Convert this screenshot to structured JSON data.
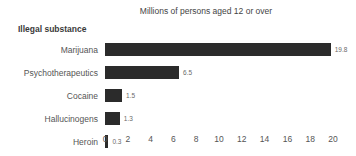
{
  "chart_data": {
    "type": "bar",
    "orientation": "horizontal",
    "title": "Millions of persons aged 12 or over",
    "ylabel": "Illegal substance",
    "xlabel": "",
    "categories": [
      "Marijuana",
      "Psychotherapeutics",
      "Cocaine",
      "Hallucinogens",
      "Heroin"
    ],
    "values": [
      19.8,
      6.5,
      1.5,
      1.3,
      0.3
    ],
    "value_labels": [
      "19.8",
      "6.5",
      "1.5",
      "1.3",
      "0.3"
    ],
    "xlim": [
      0,
      20
    ],
    "xticks": [
      0,
      2,
      4,
      6,
      8,
      10,
      12,
      14,
      16,
      18,
      20
    ],
    "xtick_labels": [
      "0",
      "2",
      "4",
      "6",
      "8",
      "10",
      "12",
      "14",
      "16",
      "18",
      "20"
    ],
    "grid": false,
    "legend": false,
    "bar_color": "#2b2b2b",
    "background_color": "#ffffff",
    "text_color": "#555555"
  }
}
